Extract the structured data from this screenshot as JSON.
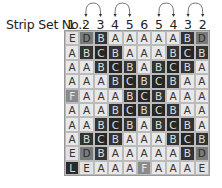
{
  "label": "Strip Set No.:",
  "strip_numbers": [
    "1",
    "2",
    "3",
    "4",
    "5",
    "6",
    "5",
    "4",
    "3",
    "2"
  ],
  "arcs": [
    [
      1,
      2
    ],
    [
      3,
      4
    ],
    [
      6,
      7
    ],
    [
      8,
      9
    ]
  ],
  "grid": [
    [
      "E",
      "D",
      "B",
      "A",
      "A",
      "A",
      "A",
      "A",
      "B",
      "D"
    ],
    [
      "A",
      "B",
      "C",
      "B",
      "A",
      "A",
      "A",
      "B",
      "C",
      "B"
    ],
    [
      "A",
      "A",
      "B",
      "C",
      "B",
      "A",
      "B",
      "C",
      "B",
      "A"
    ],
    [
      "A",
      "A",
      "A",
      "B",
      "C",
      "B",
      "C",
      "B",
      "A",
      "A"
    ],
    [
      "F",
      "A",
      "A",
      "A",
      "B",
      "C",
      "B",
      "A",
      "A",
      "A"
    ],
    [
      "A",
      "A",
      "A",
      "B",
      "C",
      "B",
      "C",
      "B",
      "A",
      "A"
    ],
    [
      "A",
      "A",
      "B",
      "C",
      "B",
      "A",
      "B",
      "C",
      "B",
      "A"
    ],
    [
      "A",
      "B",
      "C",
      "B",
      "A",
      "A",
      "A",
      "B",
      "C",
      "B"
    ],
    [
      "E",
      "D",
      "B",
      "A",
      "A",
      "A",
      "A",
      "A",
      "B",
      "D"
    ],
    [
      "L",
      "E",
      "A",
      "A",
      "A",
      "F",
      "A",
      "A",
      "A",
      "E"
    ]
  ],
  "colors": {
    "A": {
      "bg": "#e8e8e8",
      "fg": "#333333"
    },
    "B": {
      "bg": "#333333",
      "fg": "#dddddd"
    },
    "C": {
      "bg": "#262626",
      "fg": "#dddddd"
    },
    "D": {
      "bg": "#7a7a7a",
      "fg": "#2a2a2a"
    },
    "E": {
      "bg": "#e2e2e2",
      "fg": "#333333"
    },
    "F": {
      "bg": "#8a8a8a",
      "fg": "#e8e8e8"
    },
    "L": {
      "bg": "#2a2a2a",
      "fg": "#dddddd"
    }
  }
}
